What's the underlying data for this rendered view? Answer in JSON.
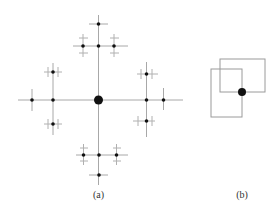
{
  "figure": {
    "panel_a": {
      "label": "(a)",
      "center": {
        "x": 98.5,
        "y": 100,
        "r": 4.5
      },
      "description": "H-tree-like recursive cross fractal with a central large node"
    },
    "panel_b": {
      "label": "(b)",
      "rect_a": {
        "x": 220,
        "y": 59,
        "w": 45,
        "h": 33
      },
      "rect_b": {
        "x": 211,
        "y": 69,
        "w": 31,
        "h": 48
      },
      "dot": {
        "x": 242,
        "y": 92,
        "r": 4
      }
    },
    "colors": {
      "line": "#a8a8a8",
      "node": "#111111",
      "background": "#ffffff"
    }
  }
}
